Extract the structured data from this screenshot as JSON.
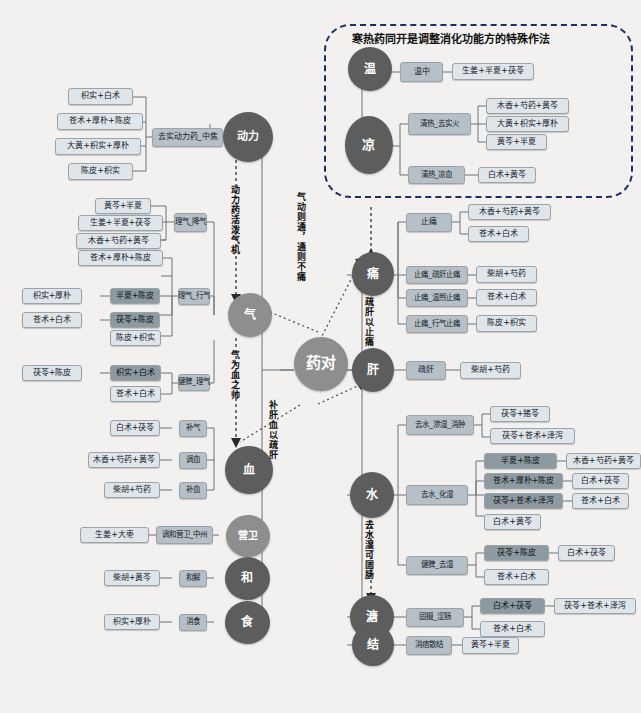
{
  "diagram": {
    "center": {
      "label": "药对"
    },
    "group_box": {
      "title": "寒热药同开是调整消化功能方的特殊作法"
    },
    "relations": [
      {
        "id": "r1",
        "text": "动力药活泼气机"
      },
      {
        "id": "r2",
        "text": "气为血之帅"
      },
      {
        "id": "r3",
        "text": "气动则通，通则不痛"
      },
      {
        "id": "r4",
        "text": "补肝血以疏肝"
      },
      {
        "id": "r5",
        "text": "疏肝以止痛"
      },
      {
        "id": "r6",
        "text": "去水湿可固肠"
      }
    ],
    "left_nodes": [
      {
        "id": "n_dongli",
        "label": "动力"
      },
      {
        "id": "n_qi",
        "label": "气"
      },
      {
        "id": "n_xue",
        "label": "血"
      },
      {
        "id": "n_yingwei",
        "label": "营卫"
      },
      {
        "id": "n_he",
        "label": "和"
      },
      {
        "id": "n_shi",
        "label": "食"
      }
    ],
    "right_nodes": [
      {
        "id": "n_wen",
        "label": "温"
      },
      {
        "id": "n_liang",
        "label": "凉"
      },
      {
        "id": "n_tong",
        "label": "痛"
      },
      {
        "id": "n_gan",
        "label": "肝"
      },
      {
        "id": "n_shui",
        "label": "水"
      },
      {
        "id": "n_tang",
        "label": "溏"
      },
      {
        "id": "n_jie",
        "label": "结"
      }
    ],
    "mid_boxes": [
      {
        "id": "m_qushi",
        "label": "去实动力药_中焦"
      },
      {
        "id": "m_ligjq",
        "label": "理气_降气"
      },
      {
        "id": "m_ligxq",
        "label": "理气_行气"
      },
      {
        "id": "m_jianpi",
        "label": "健脾_理气"
      },
      {
        "id": "m_buqi",
        "label": "补气"
      },
      {
        "id": "m_tiaoxue",
        "label": "调血"
      },
      {
        "id": "m_buxue",
        "label": "补血"
      },
      {
        "id": "m_tiaohe",
        "label": "调和营卫_中州"
      },
      {
        "id": "m_hejie",
        "label": "和解"
      },
      {
        "id": "m_xiaoshi",
        "label": "消食"
      },
      {
        "id": "m_wenzhong",
        "label": "温中"
      },
      {
        "id": "m_qingre_shihuo",
        "label": "清热_去实火"
      },
      {
        "id": "m_qingre_liangxue",
        "label": "清热_凉血"
      },
      {
        "id": "m_zhitong",
        "label": "止痛"
      },
      {
        "id": "m_zhitong_shugan",
        "label": "止痛_疏肝止痛"
      },
      {
        "id": "m_zhitong_wenxu",
        "label": "止痛_温煦止痛"
      },
      {
        "id": "m_zhitong_xingqi",
        "label": "止痛_行气止痛"
      },
      {
        "id": "m_shugan",
        "label": "疏肝"
      },
      {
        "id": "m_qushui_shenshi",
        "label": "去水_渗湿_消肿"
      },
      {
        "id": "m_qushui_huashi",
        "label": "去水_化湿"
      },
      {
        "id": "m_jianpi_qushi",
        "label": "健脾_去湿"
      },
      {
        "id": "m_gushe",
        "label": "固摄_涩肠"
      },
      {
        "id": "m_xiaopi",
        "label": "消痞散结"
      }
    ],
    "leaf_boxes": [
      {
        "id": "L01",
        "label": "枳实+白术"
      },
      {
        "id": "L02",
        "label": "苍术+厚朴+陈皮"
      },
      {
        "id": "L03",
        "label": "大黄+枳实+厚朴"
      },
      {
        "id": "L04",
        "label": "陈皮+枳实"
      },
      {
        "id": "L05",
        "label": "黄芩+半夏"
      },
      {
        "id": "L06",
        "label": "生姜+半夏+茯苓"
      },
      {
        "id": "L07",
        "label": "木香+芍药+黄芩"
      },
      {
        "id": "L08",
        "label": "苍术+厚朴+陈皮"
      },
      {
        "id": "L09",
        "label": "半夏+陈皮"
      },
      {
        "id": "L10",
        "label": "茯苓+陈皮"
      },
      {
        "id": "L11",
        "label": "陈皮+枳实"
      },
      {
        "id": "L12",
        "label": "枳实+白术"
      },
      {
        "id": "L13",
        "label": "苍术+白术"
      },
      {
        "id": "L14",
        "label": "枳实+厚朴"
      },
      {
        "id": "L15",
        "label": "苍术+白术"
      },
      {
        "id": "L16",
        "label": "茯苓+陈皮"
      },
      {
        "id": "L17",
        "label": "白术+茯苓"
      },
      {
        "id": "L18",
        "label": "木香+芍药+黄芩"
      },
      {
        "id": "L19",
        "label": "柴胡+芍药"
      },
      {
        "id": "L20",
        "label": "生姜+大枣"
      },
      {
        "id": "L21",
        "label": "柴胡+黄芩"
      },
      {
        "id": "L22",
        "label": "枳实+厚朴"
      },
      {
        "id": "R01",
        "label": "生姜+半夏+茯苓"
      },
      {
        "id": "R02",
        "label": "木香+芍药+黄芩"
      },
      {
        "id": "R03",
        "label": "大黄+枳实+厚朴"
      },
      {
        "id": "R04",
        "label": "黄芩+半夏"
      },
      {
        "id": "R05",
        "label": "白术+黄芩"
      },
      {
        "id": "R06",
        "label": "木香+芍药+黄芩"
      },
      {
        "id": "R07",
        "label": "苍术+白术"
      },
      {
        "id": "R08",
        "label": "柴胡+芍药"
      },
      {
        "id": "R09",
        "label": "苍术+白术"
      },
      {
        "id": "R10",
        "label": "陈皮+枳实"
      },
      {
        "id": "R11",
        "label": "柴胡+芍药"
      },
      {
        "id": "R12",
        "label": "茯苓+猪苓"
      },
      {
        "id": "R13",
        "label": "茯苓+苍术+泽泻"
      },
      {
        "id": "R14",
        "label": "半夏+陈皮"
      },
      {
        "id": "R15",
        "label": "木香+芍药+黄芩"
      },
      {
        "id": "R16",
        "label": "苍术+厚朴+陈皮"
      },
      {
        "id": "R17",
        "label": "白术+茯苓"
      },
      {
        "id": "R18",
        "label": "茯苓+苍术+泽泻"
      },
      {
        "id": "R19",
        "label": "苍术+白术"
      },
      {
        "id": "R20",
        "label": "白术+黄芩"
      },
      {
        "id": "R21",
        "label": "茯苓+陈皮"
      },
      {
        "id": "R22",
        "label": "白术+茯苓"
      },
      {
        "id": "R23",
        "label": "苍术+白术"
      },
      {
        "id": "R24",
        "label": "白术+茯苓"
      },
      {
        "id": "R25",
        "label": "茯苓+苍术+泽泻"
      },
      {
        "id": "R26",
        "label": "苍术+白术"
      },
      {
        "id": "R27",
        "label": "黄芩+半夏"
      }
    ]
  }
}
